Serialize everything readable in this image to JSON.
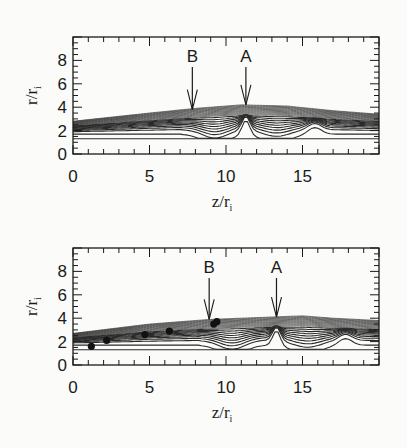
{
  "figure": {
    "panels": [
      {
        "id": "top",
        "xlabel": "z/r",
        "xlabel_sub": "i",
        "ylabel": "r/r",
        "ylabel_sub": "i",
        "xticks": [
          "0",
          "5",
          "10",
          "15"
        ],
        "yticks": [
          "0",
          "2",
          "4",
          "6",
          "8"
        ],
        "annotations": [
          {
            "label": "B",
            "z": 7.8,
            "r": 3.8
          },
          {
            "label": "A",
            "z": 11.3,
            "r": 4.2
          }
        ]
      },
      {
        "id": "bottom",
        "xlabel": "z/r",
        "xlabel_sub": "i",
        "ylabel": "r/r",
        "ylabel_sub": "i",
        "xticks": [
          "0",
          "5",
          "10",
          "15"
        ],
        "yticks": [
          "0",
          "2",
          "4",
          "6",
          "8"
        ],
        "annotations": [
          {
            "label": "B",
            "z": 8.9,
            "r": 3.9
          },
          {
            "label": "A",
            "z": 13.3,
            "r": 4.1
          }
        ]
      }
    ]
  },
  "chart_data": [
    {
      "type": "contour",
      "title": "",
      "xlabel": "z/r_i",
      "ylabel": "r/r_i",
      "xlim": [
        0,
        20
      ],
      "ylim": [
        0,
        10
      ],
      "xticks": [
        0,
        5,
        10,
        15
      ],
      "yticks": [
        0,
        2,
        4,
        6,
        8
      ],
      "grid": false,
      "annotations": [
        {
          "text": "B",
          "arrow_to": {
            "z": 7.8,
            "r": 3.8
          }
        },
        {
          "text": "A",
          "arrow_to": {
            "z": 11.3,
            "r": 4.2
          }
        }
      ],
      "outer_boundary": {
        "z": [
          0,
          5,
          8,
          11,
          14,
          17,
          20
        ],
        "r": [
          2.8,
          3.5,
          3.9,
          4.2,
          4.1,
          3.7,
          3.4
        ]
      },
      "inner_flat_line_r": 1.3
    },
    {
      "type": "contour",
      "title": "",
      "xlabel": "z/r_i",
      "ylabel": "r/r_i",
      "xlim": [
        0,
        20
      ],
      "ylim": [
        0,
        10
      ],
      "xticks": [
        0,
        5,
        10,
        15
      ],
      "yticks": [
        0,
        2,
        4,
        6,
        8
      ],
      "grid": false,
      "annotations": [
        {
          "text": "B",
          "arrow_to": {
            "z": 8.9,
            "r": 3.9
          }
        },
        {
          "text": "A",
          "arrow_to": {
            "z": 13.3,
            "r": 4.1
          }
        }
      ],
      "outer_boundary": {
        "z": [
          0,
          5,
          9,
          13,
          15,
          17,
          20
        ],
        "r": [
          2.7,
          3.5,
          3.9,
          4.1,
          4.2,
          4.0,
          3.8
        ]
      },
      "inner_flat_line_r": 1.3,
      "markers": {
        "type": "scatter",
        "z": [
          1.2,
          2.2,
          4.7,
          6.3,
          9.2,
          9.4
        ],
        "r": [
          1.6,
          2.1,
          2.6,
          2.9,
          3.5,
          3.7
        ]
      }
    }
  ]
}
